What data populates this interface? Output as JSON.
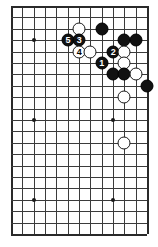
{
  "diagram": {
    "type": "go-board-diagram",
    "board": {
      "columns": 13,
      "rows": 21,
      "origin_x": 11,
      "origin_y": 6,
      "spacing_x": 11.33,
      "spacing_y": 11.4,
      "line_color": "#3b3b3b",
      "edge_color": "#2a2a2a",
      "background_color": "#ffffff"
    },
    "star_points": [
      {
        "col": 2,
        "row": 3
      },
      {
        "col": 2,
        "row": 10
      },
      {
        "col": 2,
        "row": 17
      },
      {
        "col": 9,
        "row": 10
      },
      {
        "col": 9,
        "row": 17
      }
    ],
    "stones": [
      {
        "col": 6,
        "row": 2,
        "color": "white",
        "label": ""
      },
      {
        "col": 8,
        "row": 2,
        "color": "black",
        "label": ""
      },
      {
        "col": 5,
        "row": 3,
        "color": "black",
        "label": "5"
      },
      {
        "col": 6,
        "row": 3,
        "color": "black",
        "label": "3"
      },
      {
        "col": 10,
        "row": 3,
        "color": "black",
        "label": ""
      },
      {
        "col": 11,
        "row": 3,
        "color": "black",
        "label": ""
      },
      {
        "col": 6,
        "row": 4,
        "color": "white",
        "label": "4"
      },
      {
        "col": 7,
        "row": 4,
        "color": "white",
        "label": ""
      },
      {
        "col": 9,
        "row": 4,
        "color": "black",
        "label": "2"
      },
      {
        "col": 10,
        "row": 4,
        "color": "white",
        "label": ""
      },
      {
        "col": 8,
        "row": 5,
        "color": "black",
        "label": "1"
      },
      {
        "col": 10,
        "row": 5,
        "color": "white",
        "label": ""
      },
      {
        "col": 9,
        "row": 6,
        "color": "black",
        "label": ""
      },
      {
        "col": 10,
        "row": 6,
        "color": "black",
        "label": ""
      },
      {
        "col": 11,
        "row": 6,
        "color": "white",
        "label": ""
      },
      {
        "col": 12,
        "row": 7,
        "color": "black",
        "label": ""
      },
      {
        "col": 10,
        "row": 8,
        "color": "white",
        "label": ""
      },
      {
        "col": 10,
        "row": 12,
        "color": "white",
        "label": ""
      }
    ],
    "move_labels": [
      "1",
      "2",
      "3",
      "4",
      "5"
    ]
  }
}
